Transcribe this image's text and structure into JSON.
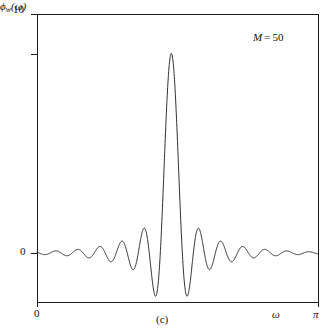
{
  "figure": {
    "caption": "(c)",
    "annotation": {
      "symbol": "M",
      "equals": "=",
      "value": "50",
      "text": "M = 50"
    }
  },
  "axes": {
    "y_label_phi": "ϕ",
    "y_label_sub": "w",
    "y_label_arg": "(ω)",
    "y_label_full": "ϕ̂_w(ω)",
    "y_ticks": [
      "10",
      "0"
    ],
    "y_tick_top": "10",
    "y_tick_zero": "0",
    "x_tick_zero": "0",
    "x_tick_pi": "π",
    "x_axis_symbol": "ω"
  },
  "style": {
    "line_color": "#1a1a1a",
    "axis_color": "#1a1a1a",
    "background": "#ffffff"
  },
  "chart_data": {
    "type": "line",
    "title": "",
    "subtitle": "",
    "xlabel": "ω",
    "ylabel": "ϕ̂_w(ω)",
    "caption": "(c)",
    "annotations": [
      {
        "text": "M = 50",
        "x": 0.82,
        "y": 9.1
      }
    ],
    "xlim": [
      0,
      3.14159265
    ],
    "ylim": [
      -2.2,
      10
    ],
    "x_ticks": [
      0,
      3.14159265
    ],
    "x_tick_labels": [
      "0",
      "π"
    ],
    "y_ticks": [
      0,
      10
    ],
    "y_tick_labels": [
      "0",
      "10"
    ],
    "grid": false,
    "legend": false,
    "model": {
      "kind": "dirichlet-kernel",
      "M": 50,
      "center_omega_over_pi": 0.478,
      "peak_value": 8.35,
      "undershoot_value": -1.95,
      "sidelobe_decay": true
    },
    "series": [
      {
        "name": "phi_hat_w",
        "n_points": 1400,
        "x_units": "omega/pi",
        "key_points": [
          {
            "x": 0.0,
            "y": 0.06
          },
          {
            "x": 0.05,
            "y": -0.05
          },
          {
            "x": 0.1,
            "y": 0.07
          },
          {
            "x": 0.15,
            "y": -0.08
          },
          {
            "x": 0.2,
            "y": 0.1
          },
          {
            "x": 0.25,
            "y": -0.13
          },
          {
            "x": 0.3,
            "y": 0.18
          },
          {
            "x": 0.34,
            "y": -0.26
          },
          {
            "x": 0.38,
            "y": 0.38
          },
          {
            "x": 0.41,
            "y": -0.55
          },
          {
            "x": 0.432,
            "y": 0.95
          },
          {
            "x": 0.448,
            "y": -1.85
          },
          {
            "x": 0.478,
            "y": 8.35
          },
          {
            "x": 0.508,
            "y": -1.95
          },
          {
            "x": 0.524,
            "y": 0.98
          },
          {
            "x": 0.546,
            "y": -0.58
          },
          {
            "x": 0.58,
            "y": 0.4
          },
          {
            "x": 0.62,
            "y": -0.27
          },
          {
            "x": 0.66,
            "y": 0.2
          },
          {
            "x": 0.7,
            "y": -0.15
          },
          {
            "x": 0.75,
            "y": 0.12
          },
          {
            "x": 0.8,
            "y": -0.1
          },
          {
            "x": 0.85,
            "y": 0.08
          },
          {
            "x": 0.9,
            "y": -0.06
          },
          {
            "x": 0.95,
            "y": 0.05
          },
          {
            "x": 1.0,
            "y": -0.04
          }
        ]
      }
    ]
  }
}
